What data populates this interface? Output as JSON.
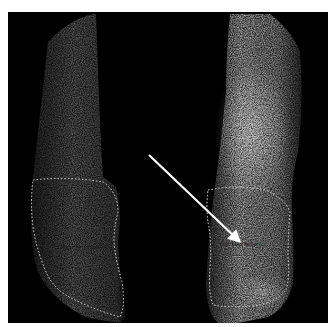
{
  "image": {
    "type": "scintigraphy-scan",
    "background_color": "#000000",
    "page_background_color": "#ffffff"
  },
  "regions": [
    {
      "id": "left-leg",
      "label": "Right Fast Pattern",
      "intensity": "low",
      "outline_style": "dashed",
      "outline_color": "#e6e6e6"
    },
    {
      "id": "right-leg",
      "label": "Left Fast Pattern",
      "intensity": "high",
      "outline_style": "dashed",
      "outline_color": "#e6e6e6"
    }
  ],
  "annotation": {
    "arrow_color": "#ffffff",
    "arrow_from": [
      149,
      155
    ],
    "arrow_to": [
      240,
      242
    ]
  }
}
